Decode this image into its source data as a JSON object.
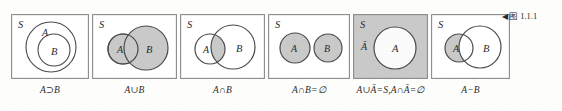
{
  "figure": {
    "reference_marker": "◀",
    "reference_label": "图",
    "reference_number": "1.1.1",
    "universe_label": "S",
    "colors": {
      "shade": "#c9c9c9",
      "stroke": "#4a4a4a",
      "box_stroke": "#8a8a8a",
      "text": "#2b2b2b",
      "paper": "#fdfdfc"
    }
  },
  "panels": [
    {
      "id": "a-superset-b",
      "caption": "A⊃B",
      "universe_label": "S",
      "set_labels": [
        "A",
        "B"
      ],
      "shading": "none",
      "relation": "B is contained in A (nested circles)",
      "width": 78
    },
    {
      "id": "a-union-b",
      "caption": "A∪B",
      "universe_label": "S",
      "set_labels": [
        "A",
        "B"
      ],
      "shading": "both-circles",
      "relation": "A and B overlap; entire union shaded",
      "width": 85
    },
    {
      "id": "a-intersect-b",
      "caption": "A∩B",
      "universe_label": "S",
      "set_labels": [
        "A",
        "B"
      ],
      "shading": "intersection-only",
      "relation": "A and B overlap; only the lens shaded",
      "width": 85
    },
    {
      "id": "a-intersect-b-empty",
      "caption": "A∩B=∅",
      "universe_label": "S",
      "set_labels": [
        "A",
        "B"
      ],
      "shading": "both-circles",
      "relation": "A and B disjoint",
      "width": 82
    },
    {
      "id": "complement",
      "caption": "A∪Ā=S,A∩Ā=∅",
      "universe_label": "S",
      "set_labels": [
        "Ā",
        "A"
      ],
      "shading": "box-only",
      "relation": "Box shaded as complement of A; circle A unshaded",
      "width": 75
    },
    {
      "id": "a-minus-b",
      "caption": "A−B",
      "universe_label": "S",
      "set_labels": [
        "A",
        "B"
      ],
      "shading": "a-minus-b-crescent",
      "relation": "A and B overlap; only part of A outside B shaded",
      "width": 79
    }
  ]
}
